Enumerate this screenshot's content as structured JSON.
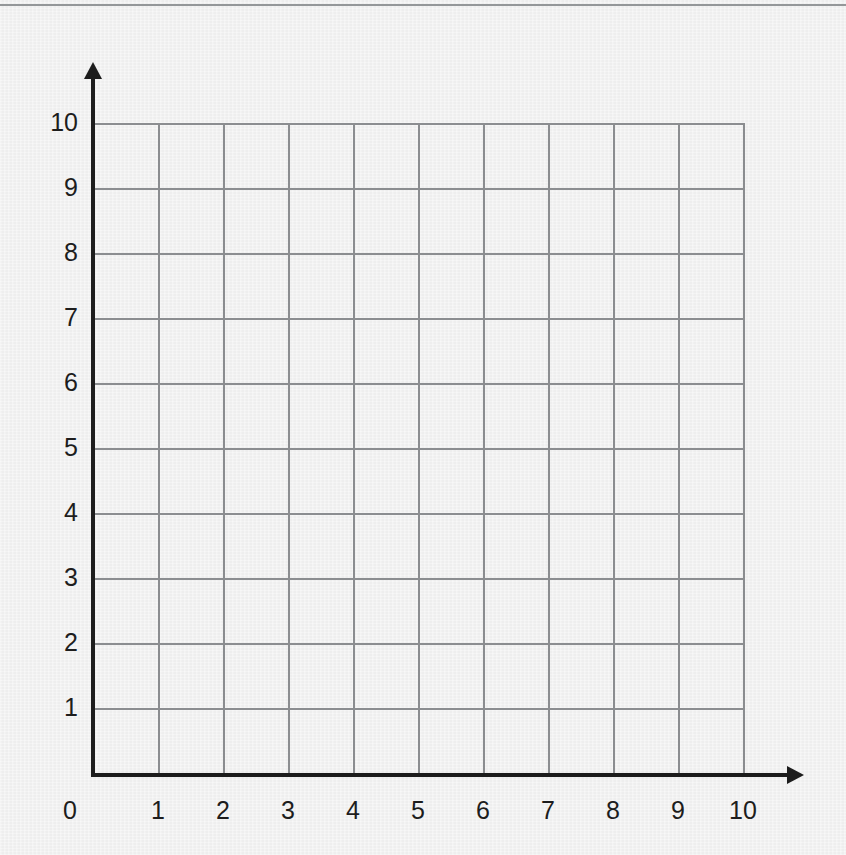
{
  "page": {
    "background_color": "#f0f0f0",
    "top_rule_color": "#8e9194",
    "axis_color": "#1d1d1d",
    "gridline_color": "#8b8d90"
  },
  "chart_data": {
    "type": "scatter",
    "title": "",
    "subtitle": "",
    "xlabel": "",
    "ylabel": "",
    "xlim": [
      0,
      10
    ],
    "ylim": [
      0,
      10
    ],
    "x_ticks": [
      "0",
      "1",
      "2",
      "3",
      "4",
      "5",
      "6",
      "7",
      "8",
      "9",
      "10"
    ],
    "y_ticks": [
      "1",
      "2",
      "3",
      "4",
      "5",
      "6",
      "7",
      "8",
      "9",
      "10"
    ],
    "grid": true,
    "grid_cells_x": 10,
    "grid_cells_y": 10,
    "legend": [],
    "annotations": [],
    "series": [
      {
        "name": "",
        "x": [],
        "y": []
      }
    ],
    "x_axis_arrow": true,
    "y_axis_arrow": true,
    "origin_label": "0"
  }
}
